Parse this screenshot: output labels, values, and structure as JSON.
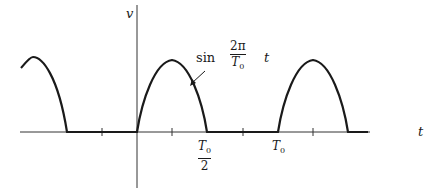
{
  "diagram": {
    "type": "half-wave rectified sine waveform",
    "axes": {
      "vertical_label": "v",
      "horizontal_label": "t"
    },
    "curve_label": {
      "func": "sin",
      "fraction_numerator": "2π",
      "fraction_denominator": "T",
      "denominator_subscript": "0",
      "variable": "t"
    },
    "tick_labels": {
      "half_period_numerator": "T",
      "half_period_subscript": "0",
      "half_period_denominator": "2",
      "period": "T",
      "period_subscript": "0"
    },
    "colors": {
      "stroke": "#1a1a1a",
      "axis": "#333333",
      "background": "#ffffff"
    }
  }
}
